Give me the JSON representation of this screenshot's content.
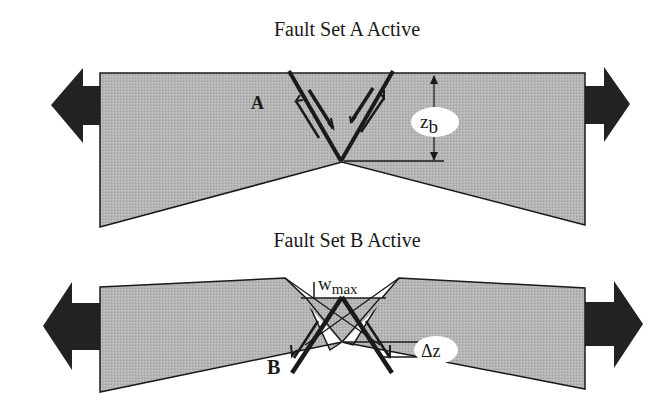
{
  "panels": [
    {
      "id": "A",
      "title": "Fault Set A Active",
      "fault_label": "A",
      "measure_label": "z",
      "measure_subscript": "b",
      "measure_meaning": "depth from block top to fault intersection"
    },
    {
      "id": "B",
      "title": "Fault Set B Active",
      "fault_label": "B",
      "width_label": "w",
      "width_subscript": "max",
      "offset_label": "Δz"
    }
  ],
  "colors": {
    "block_fill": "#b3b3b3",
    "line": "#1a1a1a",
    "arrow": "#222222",
    "label_bubble": "#ffffff"
  },
  "icons": {
    "left_arrow": "extension-arrow-left",
    "right_arrow": "extension-arrow-right"
  }
}
